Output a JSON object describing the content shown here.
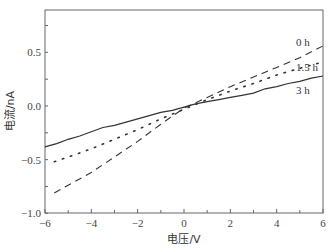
{
  "chart_data": {
    "type": "line",
    "title": "",
    "xlabel": "电压/V",
    "ylabel": "电流/nA",
    "xlim": [
      -6,
      6
    ],
    "ylim": [
      -1.0,
      0.9
    ],
    "xticks": [
      -6,
      -4,
      -2,
      0,
      2,
      4,
      6
    ],
    "xtick_labels": [
      "−6",
      "−4",
      "−2",
      "0",
      "2",
      "4",
      "6"
    ],
    "yticks": [
      -1.0,
      -0.5,
      0.0,
      0.5
    ],
    "ytick_labels": [
      "−1.0",
      "−0.5",
      "0.0",
      "0.5"
    ],
    "grid": false,
    "legend_position": "inline labels near right end",
    "series": [
      {
        "name": "0 h",
        "style": "dashed",
        "x": [
          -5.6,
          -4,
          -2,
          -1,
          0,
          1,
          2,
          3,
          4,
          5,
          6
        ],
        "y": [
          -0.81,
          -0.62,
          -0.33,
          -0.17,
          -0.02,
          0.08,
          0.18,
          0.27,
          0.36,
          0.45,
          0.56
        ]
      },
      {
        "name": "1.5 h",
        "style": "dotted",
        "x": [
          -5.6,
          -4,
          -2,
          -1,
          0,
          1,
          2,
          3,
          4,
          5,
          6
        ],
        "y": [
          -0.52,
          -0.4,
          -0.22,
          -0.12,
          -0.03,
          0.06,
          0.14,
          0.21,
          0.29,
          0.35,
          0.41
        ]
      },
      {
        "name": "3 h",
        "style": "solid",
        "x": [
          -6,
          -5.5,
          -5,
          -4.5,
          -4,
          -3.5,
          -3,
          -2.5,
          -2,
          -1.5,
          -1,
          -0.5,
          0,
          0.5,
          1,
          1.5,
          2,
          2.5,
          3,
          3.5,
          4,
          4.5,
          5,
          5.5,
          6
        ],
        "y": [
          -0.38,
          -0.35,
          -0.31,
          -0.28,
          -0.24,
          -0.2,
          -0.18,
          -0.15,
          -0.12,
          -0.09,
          -0.06,
          -0.04,
          -0.01,
          0.02,
          0.04,
          0.06,
          0.08,
          0.1,
          0.12,
          0.16,
          0.18,
          0.21,
          0.23,
          0.26,
          0.28
        ]
      }
    ],
    "annotations": [
      {
        "text": "0 h",
        "x": 4.9,
        "y": 0.58
      },
      {
        "text": "1.5 h",
        "x": 4.85,
        "y": 0.35
      },
      {
        "text": "3 h",
        "x": 4.85,
        "y": 0.14
      }
    ]
  },
  "labels": {
    "xlabel": "电压/V",
    "ylabel": "电流/nA",
    "series_0": "0 h",
    "series_1": "1.5 h",
    "series_2": "3 h"
  }
}
